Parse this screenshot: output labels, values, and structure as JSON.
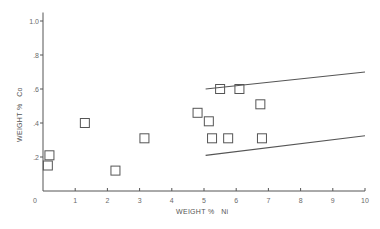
{
  "chart_data": {
    "type": "scatter",
    "title": "",
    "xlabel": "WEIGHT %   Ni",
    "ylabel": "WEIGHT %   Co",
    "xlim": [
      0,
      10
    ],
    "ylim": [
      0,
      1.05
    ],
    "grid": false,
    "legend": null,
    "x_ticks": [
      0,
      1,
      2,
      3,
      4,
      5,
      6,
      7,
      8,
      9,
      10
    ],
    "x_tick_labels": [
      "0",
      "1",
      "2",
      "3",
      "4",
      "5",
      "6",
      "7",
      "8",
      "9",
      "10"
    ],
    "y_ticks": [
      0.2,
      0.4,
      0.6,
      0.8,
      1.0
    ],
    "y_tick_labels": [
      ".2",
      ".4",
      ".6",
      ".8",
      "1.0"
    ],
    "origin_label": "0",
    "marker": "open-square",
    "series": [
      {
        "name": "samples",
        "points": [
          {
            "x": 0.2,
            "y": 0.21
          },
          {
            "x": 0.15,
            "y": 0.15
          },
          {
            "x": 1.3,
            "y": 0.4
          },
          {
            "x": 2.25,
            "y": 0.12
          },
          {
            "x": 3.15,
            "y": 0.31
          },
          {
            "x": 4.8,
            "y": 0.46
          },
          {
            "x": 5.15,
            "y": 0.41
          },
          {
            "x": 5.25,
            "y": 0.31
          },
          {
            "x": 5.5,
            "y": 0.6
          },
          {
            "x": 5.75,
            "y": 0.31
          },
          {
            "x": 6.1,
            "y": 0.6
          },
          {
            "x": 6.75,
            "y": 0.51
          },
          {
            "x": 6.8,
            "y": 0.31
          }
        ]
      }
    ],
    "lines": [
      {
        "name": "upper-bound",
        "from": {
          "x": 5.05,
          "y": 0.6
        },
        "to": {
          "x": 10,
          "y": 0.7
        }
      },
      {
        "name": "lower-bound",
        "from": {
          "x": 5.05,
          "y": 0.21
        },
        "to": {
          "x": 10,
          "y": 0.325
        }
      }
    ],
    "colors": {
      "ink": "#555555",
      "background": "#ffffff"
    }
  }
}
